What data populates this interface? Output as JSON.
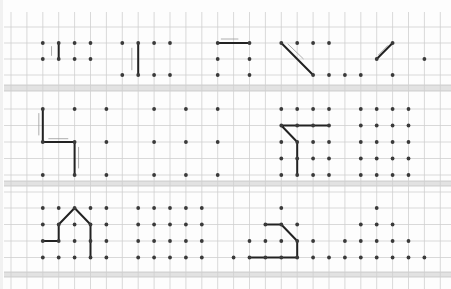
{
  "worksheet": {
    "title": "",
    "colors": {
      "paper": "#fdfdfd",
      "grid": "#cfcfcf",
      "band": "#e2e2e2",
      "dot": "#3a3a3a",
      "line": "#222222",
      "hint": "#9a9a9a"
    },
    "grid": {
      "x0": 11,
      "dx": 15.9,
      "columns": 28,
      "rows_y": [
        27,
        43,
        59,
        75,
        109,
        125.5,
        142,
        158.5,
        175,
        192,
        208,
        224.5,
        241,
        257.5
      ],
      "bands_y": [
        [
          85,
          91
        ],
        [
          181,
          186
        ],
        [
          272,
          277
        ]
      ]
    },
    "sections": [
      {
        "name": "row-1",
        "row_y": [
          43,
          59,
          75
        ],
        "figures": [
          {
            "name": "figure-vertical-short",
            "dots": [
              [
                2,
                0
              ],
              [
                3,
                0
              ],
              [
                4,
                0
              ],
              [
                5,
                0
              ],
              [
                2,
                1
              ],
              [
                3,
                1
              ],
              [
                4,
                1
              ],
              [
                5,
                1
              ]
            ],
            "path": [
              [
                3,
                0
              ],
              [
                3,
                1
              ]
            ],
            "hints": [
              [
                [
                  2.55,
                  0.2
                ],
                [
                  2.55,
                  0.8
                ]
              ]
            ]
          },
          {
            "name": "figure-vertical-long",
            "dots": [
              [
                7,
                0
              ],
              [
                8,
                0
              ],
              [
                9,
                0
              ],
              [
                10,
                0
              ],
              [
                7,
                2
              ],
              [
                8,
                2
              ],
              [
                9,
                2
              ],
              [
                10,
                2
              ]
            ],
            "path": [
              [
                8,
                0
              ],
              [
                8,
                2
              ]
            ],
            "hints": [
              [
                [
                  7.6,
                  0.3
                ],
                [
                  7.6,
                  1.7
                ]
              ]
            ]
          },
          {
            "name": "figure-horizontal",
            "dots": [
              [
                13,
                0
              ],
              [
                13,
                1
              ],
              [
                13,
                2
              ],
              [
                15,
                0
              ],
              [
                15,
                1
              ],
              [
                15,
                2
              ]
            ],
            "path": [
              [
                13,
                0
              ],
              [
                15,
                0
              ]
            ],
            "hints": [
              [
                [
                  13.2,
                  -0.25
                ],
                [
                  14.3,
                  -0.25
                ]
              ]
            ]
          },
          {
            "name": "figure-diagonal-down",
            "dots": [
              [
                17,
                0
              ],
              [
                18,
                0
              ],
              [
                19,
                0
              ],
              [
                20,
                0
              ],
              [
                19,
                2
              ],
              [
                20,
                2
              ],
              [
                21,
                2
              ],
              [
                22,
                2
              ]
            ],
            "path": [
              [
                17,
                0
              ],
              [
                19,
                2
              ]
            ],
            "hints": [
              [
                [
                  17.4,
                  0.05
                ],
                [
                  18.4,
                  1.0
                ]
              ]
            ]
          },
          {
            "name": "figure-diagonal-up",
            "dots": [
              [
                24,
                0
              ],
              [
                23,
                1
              ],
              [
                26,
                1
              ],
              [
                24,
                2
              ]
            ],
            "path": [
              [
                23,
                1
              ],
              [
                24,
                0
              ]
            ],
            "hints": [
              [
                [
                  23.1,
                  0.75
                ],
                [
                  23.7,
                  0.15
                ]
              ]
            ]
          }
        ]
      },
      {
        "name": "row-2",
        "row_y": [
          109,
          125.5,
          142,
          158.5,
          175
        ],
        "figures": [
          {
            "name": "figure-step",
            "dots": [
              [
                2,
                0
              ],
              [
                4,
                0
              ],
              [
                6,
                0
              ],
              [
                2,
                2
              ],
              [
                4,
                2
              ],
              [
                6,
                2
              ],
              [
                2,
                4
              ],
              [
                4,
                4
              ],
              [
                6,
                4
              ]
            ],
            "path": [
              [
                2,
                0
              ],
              [
                2,
                2
              ],
              [
                4,
                2
              ],
              [
                4,
                4
              ]
            ],
            "hints": [
              [
                [
                  1.75,
                  0.25
                ],
                [
                  1.75,
                  1.6
                ]
              ],
              [
                [
                  2.35,
                  1.8
                ],
                [
                  3.6,
                  1.8
                ]
              ],
              [
                [
                  4.25,
                  2.3
                ],
                [
                  4.25,
                  3.6
                ]
              ]
            ]
          },
          {
            "name": "figure-step-blank",
            "dots": [
              [
                9,
                0
              ],
              [
                11,
                0
              ],
              [
                13,
                0
              ],
              [
                9,
                2
              ],
              [
                11,
                2
              ],
              [
                13,
                2
              ],
              [
                9,
                4
              ],
              [
                11,
                4
              ],
              [
                13,
                4
              ]
            ],
            "path": [],
            "hints": []
          },
          {
            "name": "figure-flag",
            "dots": [
              [
                17,
                0
              ],
              [
                18,
                0
              ],
              [
                19,
                0
              ],
              [
                20,
                0
              ],
              [
                17,
                1
              ],
              [
                18,
                1
              ],
              [
                19,
                1
              ],
              [
                20,
                1
              ],
              [
                17,
                2
              ],
              [
                18,
                2
              ],
              [
                19,
                2
              ],
              [
                20,
                2
              ],
              [
                17,
                3
              ],
              [
                18,
                3
              ],
              [
                19,
                3
              ],
              [
                20,
                3
              ],
              [
                17,
                4
              ],
              [
                18,
                4
              ],
              [
                19,
                4
              ],
              [
                20,
                4
              ]
            ],
            "path": [
              [
                20,
                1
              ],
              [
                17,
                1
              ],
              [
                18,
                2
              ],
              [
                18,
                4
              ]
            ],
            "hints": []
          },
          {
            "name": "figure-flag-blank",
            "dots": [
              [
                22,
                0
              ],
              [
                23,
                0
              ],
              [
                24,
                0
              ],
              [
                25,
                0
              ],
              [
                22,
                1
              ],
              [
                23,
                1
              ],
              [
                24,
                1
              ],
              [
                25,
                1
              ],
              [
                22,
                2
              ],
              [
                23,
                2
              ],
              [
                24,
                2
              ],
              [
                25,
                2
              ],
              [
                22,
                3
              ],
              [
                23,
                3
              ],
              [
                24,
                3
              ],
              [
                25,
                3
              ],
              [
                22,
                4
              ],
              [
                23,
                4
              ],
              [
                24,
                4
              ],
              [
                25,
                4
              ]
            ],
            "path": [],
            "hints": []
          }
        ]
      },
      {
        "name": "row-3",
        "row_y": [
          208,
          224.5,
          241,
          257.5
        ],
        "figures": [
          {
            "name": "figure-house",
            "dots": [
              [
                2,
                0
              ],
              [
                3,
                0
              ],
              [
                4,
                0
              ],
              [
                5,
                0
              ],
              [
                6,
                0
              ],
              [
                2,
                1
              ],
              [
                3,
                1
              ],
              [
                4,
                1
              ],
              [
                5,
                1
              ],
              [
                6,
                1
              ],
              [
                2,
                2
              ],
              [
                3,
                2
              ],
              [
                4,
                2
              ],
              [
                5,
                2
              ],
              [
                6,
                2
              ],
              [
                2,
                3
              ],
              [
                3,
                3
              ],
              [
                4,
                3
              ],
              [
                5,
                3
              ],
              [
                6,
                3
              ]
            ],
            "path": [
              [
                2,
                2
              ],
              [
                3,
                2
              ],
              [
                3,
                1
              ],
              [
                4,
                0
              ],
              [
                5,
                1
              ],
              [
                5,
                3
              ]
            ],
            "hints": []
          },
          {
            "name": "figure-house-blank",
            "dots": [
              [
                8,
                0
              ],
              [
                9,
                0
              ],
              [
                10,
                0
              ],
              [
                11,
                0
              ],
              [
                12,
                0
              ],
              [
                8,
                1
              ],
              [
                9,
                1
              ],
              [
                10,
                1
              ],
              [
                11,
                1
              ],
              [
                12,
                1
              ],
              [
                8,
                2
              ],
              [
                9,
                2
              ],
              [
                10,
                2
              ],
              [
                11,
                2
              ],
              [
                12,
                2
              ],
              [
                8,
                3
              ],
              [
                9,
                3
              ],
              [
                10,
                3
              ],
              [
                11,
                3
              ],
              [
                12,
                3
              ]
            ],
            "path": [],
            "hints": []
          },
          {
            "name": "figure-trapezoid",
            "dots": [
              [
                17,
                0
              ],
              [
                16,
                1
              ],
              [
                17,
                1
              ],
              [
                18,
                1
              ],
              [
                15,
                2
              ],
              [
                16,
                2
              ],
              [
                17,
                2
              ],
              [
                18,
                2
              ],
              [
                19,
                2
              ],
              [
                14,
                3
              ],
              [
                15,
                3
              ],
              [
                16,
                3
              ],
              [
                17,
                3
              ],
              [
                18,
                3
              ],
              [
                19,
                3
              ],
              [
                20,
                3
              ]
            ],
            "path": [
              [
                16,
                1
              ],
              [
                17,
                1
              ],
              [
                18,
                2
              ],
              [
                18,
                3
              ],
              [
                15,
                3
              ]
            ],
            "hints": []
          },
          {
            "name": "figure-trapezoid-blank",
            "dots": [
              [
                23,
                0
              ],
              [
                22,
                1
              ],
              [
                23,
                1
              ],
              [
                24,
                1
              ],
              [
                21,
                2
              ],
              [
                22,
                2
              ],
              [
                23,
                2
              ],
              [
                24,
                2
              ],
              [
                25,
                2
              ],
              [
                21,
                3
              ],
              [
                22,
                3
              ],
              [
                23,
                3
              ],
              [
                24,
                3
              ],
              [
                25,
                3
              ],
              [
                26,
                3
              ]
            ],
            "path": [],
            "hints": []
          }
        ]
      }
    ]
  }
}
